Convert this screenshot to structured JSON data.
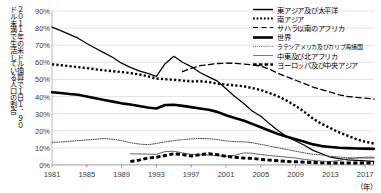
{
  "chart_data": {
    "type": "line",
    "title": "",
    "xlabel": "（年）",
    "ylabel": "2011年の米ドル換算で1日1．90ドル未満で生活している人口の割合",
    "ylabel_col_right": "２０１１年の米ドル換算で１日１．９０",
    "ylabel_col_left": "ドル未満で生活している人口の割合",
    "xlim": [
      1981,
      2018
    ],
    "ylim": [
      0,
      90
    ],
    "ytick_labels": [
      "0%",
      "10%",
      "20%",
      "30%",
      "40%",
      "50%",
      "60%",
      "70%",
      "80%",
      "90%"
    ],
    "ytick_values": [
      0,
      10,
      20,
      30,
      40,
      50,
      60,
      70,
      80,
      90
    ],
    "xtick_labels": [
      "1981",
      "1985",
      "1989",
      "1993",
      "1997",
      "2001",
      "2005",
      "2009",
      "2013",
      "2017"
    ],
    "xtick_values": [
      1981,
      1985,
      1989,
      1993,
      1997,
      2001,
      2005,
      2009,
      2013,
      2017
    ],
    "grid": "horizontal",
    "legend_position": "top-right",
    "x": [
      1981,
      1982,
      1983,
      1984,
      1985,
      1986,
      1987,
      1988,
      1989,
      1990,
      1991,
      1992,
      1993,
      1994,
      1995,
      1996,
      1997,
      1998,
      1999,
      2000,
      2001,
      2002,
      2003,
      2004,
      2005,
      2006,
      2007,
      2008,
      2009,
      2010,
      2011,
      2012,
      2013,
      2014,
      2015,
      2016,
      2017,
      2018
    ],
    "series": [
      {
        "name": "東アジア及び太平洋",
        "style": "solid-thin",
        "values": [
          80.6,
          78.5,
          76.3,
          74.1,
          71.0,
          68.2,
          65.5,
          62.8,
          59.5,
          57.0,
          55.0,
          53.5,
          51.8,
          59.2,
          63.5,
          60.0,
          57.5,
          54.0,
          51.5,
          49.0,
          44.5,
          40.0,
          36.0,
          31.5,
          28.5,
          24.0,
          20.0,
          16.5,
          14.0,
          11.5,
          8.5,
          6.5,
          4.5,
          3.6,
          3.0,
          2.6,
          2.3,
          2.1
        ]
      },
      {
        "name": "南アジア",
        "style": "dotted-bold",
        "values": [
          58.8,
          58.3,
          57.8,
          57.2,
          56.6,
          55.9,
          55.3,
          54.8,
          54.3,
          53.7,
          52.9,
          51.8,
          50.5,
          50.1,
          49.8,
          49.3,
          48.8,
          48.9,
          48.5,
          47.5,
          47.0,
          46.5,
          46.0,
          45.0,
          43.8,
          42.0,
          40.0,
          37.5,
          34.5,
          31.0,
          27.0,
          24.0,
          21.5,
          19.0,
          17.0,
          15.0,
          13.5,
          12.5
        ]
      },
      {
        "name": "サハラ以南のアフリカ",
        "style": "dashed",
        "values": [
          null,
          null,
          null,
          null,
          null,
          null,
          null,
          null,
          null,
          null,
          null,
          null,
          null,
          null,
          null,
          54.5,
          56.5,
          58.0,
          58.7,
          59.3,
          59.5,
          59.4,
          59.0,
          58.5,
          57.8,
          56.0,
          53.5,
          51.5,
          49.5,
          47.5,
          45.5,
          44.0,
          42.5,
          41.0,
          40.0,
          39.5,
          39.0,
          38.5
        ]
      },
      {
        "name": "世界",
        "style": "solid-bold",
        "values": [
          42.5,
          42.0,
          41.5,
          41.0,
          40.0,
          39.0,
          38.0,
          37.0,
          36.0,
          35.3,
          34.5,
          33.6,
          33.0,
          35.0,
          35.2,
          34.5,
          33.8,
          33.0,
          32.2,
          31.0,
          29.0,
          27.5,
          26.0,
          24.0,
          22.0,
          20.0,
          18.0,
          16.5,
          15.0,
          13.5,
          12.0,
          11.0,
          10.5,
          10.0,
          9.8,
          9.6,
          9.5,
          9.4
        ]
      },
      {
        "name": "ラテンアメリカ及びカリブ海諸国",
        "style": "dotted-fine",
        "values": [
          13.2,
          13.4,
          13.8,
          14.2,
          14.6,
          15.0,
          15.4,
          15.0,
          14.2,
          13.0,
          12.2,
          11.8,
          12.5,
          13.5,
          14.2,
          14.8,
          15.2,
          15.5,
          15.3,
          14.8,
          14.0,
          13.6,
          13.5,
          13.0,
          12.0,
          11.0,
          10.0,
          9.0,
          8.0,
          7.0,
          6.2,
          5.8,
          5.0,
          4.6,
          4.2,
          4.0,
          4.0,
          4.0
        ]
      },
      {
        "name": "中東及び北アフリカ",
        "style": "solid-fine",
        "values": [
          null,
          null,
          null,
          null,
          null,
          null,
          null,
          null,
          null,
          6.5,
          6.4,
          6.3,
          6.2,
          7.8,
          8.0,
          7.0,
          6.2,
          6.0,
          5.8,
          5.4,
          5.0,
          5.6,
          7.0,
          6.8,
          6.0,
          5.5,
          5.0,
          4.5,
          4.0,
          3.2,
          2.6,
          2.2,
          2.0,
          2.6,
          3.6,
          4.2,
          4.5,
          4.5
        ]
      },
      {
        "name": "ヨーロッパ及び中央アジア",
        "style": "dashed-bold",
        "values": [
          null,
          null,
          null,
          null,
          null,
          null,
          null,
          null,
          null,
          2.0,
          2.8,
          4.0,
          4.5,
          5.5,
          6.5,
          6.0,
          5.2,
          6.0,
          6.5,
          6.0,
          5.0,
          4.5,
          4.0,
          3.8,
          3.2,
          2.8,
          2.4,
          2.0,
          1.8,
          1.6,
          1.4,
          1.2,
          1.1,
          1.1,
          1.1,
          1.1,
          1.1,
          1.1
        ]
      }
    ]
  },
  "axis": {
    "y_unit_suffix": "%",
    "x_unit": "（年）"
  }
}
